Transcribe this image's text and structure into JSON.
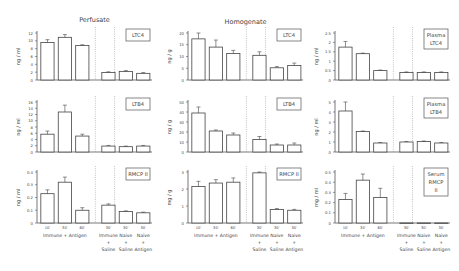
{
  "chart_data": [
    {
      "column": "Perfusate",
      "panels": [
        {
          "label": "LTC4",
          "type": "bar",
          "ylabel": "ng / ml",
          "ylim": [
            0,
            12
          ],
          "yticks": [
            0,
            2,
            4,
            6,
            8,
            10,
            12
          ],
          "values": [
            9.6,
            10.9,
            8.8,
            1.9,
            2.2,
            1.7
          ],
          "errors": [
            0.7,
            0.7,
            0.2,
            0.2,
            0.2,
            0.2
          ]
        },
        {
          "label": "LTB4",
          "type": "bar",
          "ylabel": "ng / ml",
          "ylim": [
            0,
            16
          ],
          "yticks": [
            0,
            2,
            4,
            6,
            8,
            10,
            12,
            14,
            16
          ],
          "values": [
            5.7,
            12.8,
            5.1,
            1.9,
            1.7,
            1.9
          ],
          "errors": [
            1.0,
            2.2,
            0.6,
            0.2,
            0.2,
            0.2
          ]
        },
        {
          "label": "RMCP II",
          "type": "bar",
          "ylabel": "ng / ml",
          "ylim": [
            0,
            0.4
          ],
          "yticks": [
            0,
            0.1,
            0.2,
            0.3,
            0.4
          ],
          "values": [
            0.23,
            0.32,
            0.1,
            0.14,
            0.09,
            0.08
          ],
          "errors": [
            0.03,
            0.04,
            0.02,
            0.01,
            0.005,
            0.005
          ]
        }
      ]
    },
    {
      "column": "Homogenate",
      "panels": [
        {
          "label": "LTC4",
          "type": "bar",
          "ylabel": "ng / g",
          "ylim": [
            0,
            20
          ],
          "yticks": [
            0,
            5,
            10,
            15,
            20
          ],
          "values": [
            17.5,
            14,
            11.3,
            10.5,
            5.2,
            6.2
          ],
          "errors": [
            2.5,
            3.0,
            1.3,
            1.5,
            0.5,
            1.0
          ]
        },
        {
          "label": "LTB4",
          "type": "bar",
          "ylabel": "ng / g",
          "ylim": [
            0,
            50
          ],
          "yticks": [
            0,
            10,
            20,
            30,
            40,
            50
          ],
          "values": [
            39,
            21,
            17,
            12.5,
            7,
            7
          ],
          "errors": [
            6,
            1,
            2,
            3,
            1,
            2
          ]
        },
        {
          "label": "RMCP II",
          "type": "bar",
          "ylabel": "mg / g",
          "ylim": [
            0,
            3
          ],
          "yticks": [
            0,
            1,
            2,
            3
          ],
          "values": [
            2.15,
            2.35,
            2.4,
            2.95,
            0.8,
            0.75
          ],
          "errors": [
            0.3,
            0.2,
            0.25,
            0.05,
            0.05,
            0.05
          ]
        }
      ]
    },
    {
      "column": "Plasma",
      "panels": [
        {
          "label": "Plasma LTC4",
          "type": "bar",
          "ylabel": "ng / ml",
          "ylim": [
            0,
            2.5
          ],
          "yticks": [
            0,
            0.5,
            1.0,
            1.5,
            2.0,
            2.5
          ],
          "values": [
            1.75,
            1.4,
            0.5,
            0.4,
            0.4,
            0.4
          ],
          "errors": [
            0.3,
            0.03,
            0.03,
            0.03,
            0.03,
            0.03
          ]
        },
        {
          "label": "Plasma LTB4",
          "type": "bar",
          "ylabel": "ng / ml",
          "ylim": [
            0,
            5
          ],
          "yticks": [
            0,
            1,
            2,
            3,
            4,
            5
          ],
          "values": [
            4.1,
            2.05,
            0.9,
            1.0,
            1.05,
            0.9
          ],
          "errors": [
            0.9,
            0.05,
            0.05,
            0.05,
            0.05,
            0.05
          ]
        },
        {
          "label": "Serum RMCP II",
          "type": "bar",
          "ylabel": "mg / ml",
          "ylim": [
            0,
            0.5
          ],
          "yticks": [
            0,
            0.1,
            0.2,
            0.3,
            0.4,
            0.5
          ],
          "values": [
            0.23,
            0.42,
            0.25,
            0,
            0,
            0
          ],
          "errors": [
            0.06,
            0.06,
            0.09,
            0,
            0,
            0
          ]
        }
      ]
    }
  ],
  "x_tick_labels": [
    "10'",
    "30'",
    "60'",
    "30'",
    "30'",
    "30'"
  ],
  "x_groups": [
    {
      "lines": [
        "Immune + Antigen"
      ]
    },
    {
      "lines": [
        "Immune",
        "+",
        "Saline"
      ]
    },
    {
      "lines": [
        "Naive",
        "+",
        "Saline"
      ]
    },
    {
      "lines": [
        "Naive",
        "+",
        "Antigen"
      ]
    }
  ]
}
